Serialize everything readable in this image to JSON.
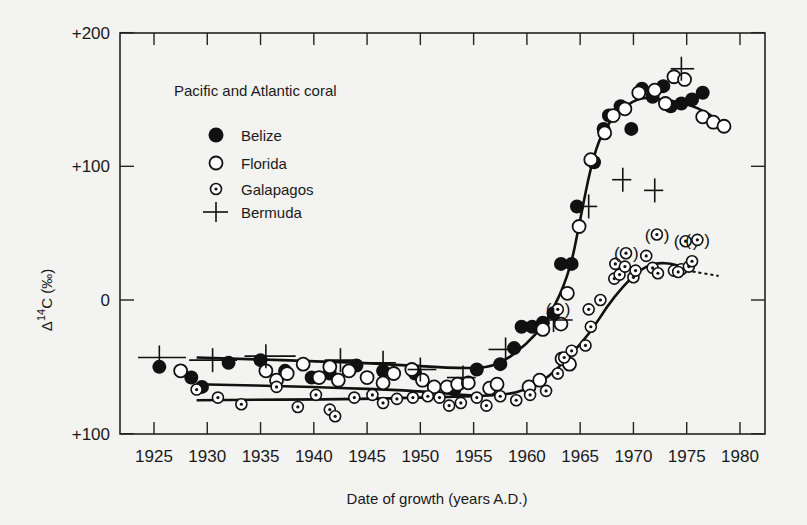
{
  "chart_data": {
    "type": "scatter",
    "title": "Pacific and Atlantic coral",
    "xlabel": "Date of growth (years A.D.)",
    "ylabel": "Δ14C (‰)",
    "xlim": [
      1922,
      1982
    ],
    "ylim": [
      -100,
      200
    ],
    "x_ticks": [
      1925,
      1930,
      1935,
      1940,
      1945,
      1950,
      1955,
      1960,
      1965,
      1970,
      1975,
      1980
    ],
    "y_ticks": [
      {
        "value": 200,
        "label": "+200"
      },
      {
        "value": 100,
        "label": "+100"
      },
      {
        "value": 0,
        "label": "0"
      },
      {
        "value": -100,
        "label": "+100"
      }
    ],
    "grid": false,
    "legend_position": "upper-left",
    "series": [
      {
        "name": "Belize",
        "marker": "filled-circle",
        "points": [
          [
            1925.5,
            -50
          ],
          [
            1928.5,
            -58
          ],
          [
            1929.5,
            -65
          ],
          [
            1932,
            -47
          ],
          [
            1935,
            -45
          ],
          [
            1937.3,
            -53
          ],
          [
            1939.8,
            -58
          ],
          [
            1941.5,
            -55
          ],
          [
            1944,
            -49
          ],
          [
            1946.5,
            -53
          ],
          [
            1949.5,
            -55
          ],
          [
            1953.2,
            -67
          ],
          [
            1955.3,
            -52
          ],
          [
            1957.5,
            -48
          ],
          [
            1958.8,
            -36
          ],
          [
            1959.5,
            -20
          ],
          [
            1960.5,
            -20
          ],
          [
            1961.5,
            -17
          ],
          [
            1962.5,
            -10
          ],
          [
            1963.2,
            27
          ],
          [
            1964.2,
            27
          ],
          [
            1964.7,
            70
          ],
          [
            1966.3,
            103
          ],
          [
            1967.2,
            128
          ],
          [
            1967.7,
            138
          ],
          [
            1968.8,
            145
          ],
          [
            1969.8,
            128
          ],
          [
            1970.8,
            158
          ],
          [
            1971.8,
            152
          ],
          [
            1972.8,
            160
          ],
          [
            1973.5,
            145
          ],
          [
            1974.5,
            147
          ],
          [
            1975.5,
            150
          ],
          [
            1976.5,
            155
          ]
        ]
      },
      {
        "name": "Florida",
        "marker": "open-circle",
        "points": [
          [
            1927.5,
            -53
          ],
          [
            1935.5,
            -53
          ],
          [
            1936.5,
            -60
          ],
          [
            1937.5,
            -55
          ],
          [
            1939,
            -48
          ],
          [
            1940.5,
            -58
          ],
          [
            1941.5,
            -50
          ],
          [
            1942.3,
            -60
          ],
          [
            1943.3,
            -53
          ],
          [
            1945,
            -58
          ],
          [
            1946.5,
            -62
          ],
          [
            1947.5,
            -55
          ],
          [
            1949.2,
            -52
          ],
          [
            1950.2,
            -60
          ],
          [
            1951.3,
            -65
          ],
          [
            1952.5,
            -65
          ],
          [
            1953.5,
            -63
          ],
          [
            1954.5,
            -62
          ],
          [
            1956.5,
            -66
          ],
          [
            1957.2,
            -63
          ],
          [
            1960.2,
            -65
          ],
          [
            1961.2,
            -60
          ],
          [
            1963.3,
            -44
          ],
          [
            1964,
            -48
          ],
          [
            1961.5,
            -22
          ],
          [
            1963.2,
            -18
          ],
          [
            1963.8,
            5
          ],
          [
            1964.9,
            55
          ],
          [
            1966,
            105
          ],
          [
            1967.3,
            125
          ],
          [
            1968.1,
            138
          ],
          [
            1969.2,
            143
          ],
          [
            1970.5,
            155
          ],
          [
            1972,
            157
          ],
          [
            1973,
            147
          ],
          [
            1973.8,
            167
          ],
          [
            1974.8,
            165
          ],
          [
            1976.5,
            137
          ],
          [
            1977.5,
            133
          ],
          [
            1978.5,
            130
          ]
        ]
      },
      {
        "name": "Galapagos",
        "marker": "dotted-circle",
        "points": [
          [
            1929,
            -67
          ],
          [
            1931,
            -73
          ],
          [
            1933.2,
            -78
          ],
          [
            1936.5,
            -65
          ],
          [
            1938.5,
            -80
          ],
          [
            1940.2,
            -71
          ],
          [
            1941.5,
            -82
          ],
          [
            1942,
            -87
          ],
          [
            1943.8,
            -73
          ],
          [
            1945.5,
            -71
          ],
          [
            1946.5,
            -77
          ],
          [
            1947.8,
            -74
          ],
          [
            1949.3,
            -73
          ],
          [
            1950.7,
            -72
          ],
          [
            1951.8,
            -73
          ],
          [
            1952.7,
            -79
          ],
          [
            1953.8,
            -77
          ],
          [
            1955.3,
            -73
          ],
          [
            1956.2,
            -79
          ],
          [
            1957.5,
            -72
          ],
          [
            1959,
            -75
          ],
          [
            1960.3,
            -71
          ],
          [
            1961.8,
            -68
          ],
          [
            1962.9,
            -55
          ],
          [
            1963.5,
            -43
          ],
          [
            1964.2,
            -38
          ],
          [
            1965.5,
            -34
          ],
          [
            1966,
            -20
          ],
          [
            1965.8,
            -7
          ],
          [
            1966.9,
            0
          ],
          [
            1968.2,
            16
          ],
          [
            1968.7,
            19
          ],
          [
            1970,
            17
          ],
          [
            1968.3,
            27
          ],
          [
            1969.2,
            25
          ],
          [
            1970.2,
            22
          ],
          [
            1971.2,
            33
          ],
          [
            1971.8,
            24
          ],
          [
            1972.3,
            20
          ],
          [
            1973.8,
            22
          ],
          [
            1974.5,
            23
          ],
          [
            1974.2,
            21
          ],
          [
            1975.2,
            25
          ],
          [
            1975.5,
            29
          ]
        ],
        "bracketed_points": [
          [
            1962.9,
            -7
          ],
          [
            1969.3,
            35
          ],
          [
            1972.2,
            49
          ],
          [
            1974.9,
            44
          ],
          [
            1976,
            45
          ]
        ]
      },
      {
        "name": "Bermuda",
        "marker": "plus",
        "points": [
          {
            "x": 1925.5,
            "y": -43,
            "xerr_left": 2.0,
            "xerr_right": 2.5
          },
          {
            "x": 1930.5,
            "y": -45,
            "xerr_left": 2.2,
            "xerr_right": 2.3
          },
          {
            "x": 1935.5,
            "y": -42,
            "xerr_left": 2.0,
            "xerr_right": 2.8
          },
          {
            "x": 1942.5,
            "y": -45,
            "xerr_left": 1.5,
            "xerr_right": 1.5
          },
          {
            "x": 1946.5,
            "y": -47,
            "xerr_left": 1.5,
            "xerr_right": 1.2
          },
          {
            "x": 1950,
            "y": -52,
            "xerr_left": 1.2,
            "xerr_right": 1.5
          },
          {
            "x": 1954,
            "y": -58,
            "xerr_left": 1.5,
            "xerr_right": 1.2
          },
          {
            "x": 1958,
            "y": -37,
            "xerr_left": 1.6,
            "xerr_right": 0.8
          },
          {
            "x": 1962.5,
            "y": -15,
            "xerr_left": 1.2,
            "xerr_right": 1.8
          },
          {
            "x": 1965.8,
            "y": 70,
            "xerr_left": 0.8,
            "xerr_right": 0.8
          },
          {
            "x": 1969,
            "y": 90,
            "xerr_left": 1.0,
            "xerr_right": 0.8
          },
          {
            "x": 1972,
            "y": 82,
            "xerr_left": 1.0,
            "xerr_right": 0.8
          },
          {
            "x": 1974.5,
            "y": 173,
            "xerr_left": 1.0,
            "xerr_right": 1.2
          }
        ]
      }
    ],
    "trend_lines": [
      {
        "name": "Atlantic (Belize/Florida) fit",
        "style": "solid",
        "points": [
          [
            1929,
            -43
          ],
          [
            1945,
            -47
          ],
          [
            1955,
            -52
          ],
          [
            1957.5,
            -48
          ],
          [
            1960,
            -33
          ],
          [
            1962,
            -15
          ],
          [
            1964,
            20
          ],
          [
            1965,
            60
          ],
          [
            1966,
            100
          ],
          [
            1967,
            125
          ],
          [
            1968.5,
            140
          ],
          [
            1970.5,
            152
          ],
          [
            1972.5,
            150
          ],
          [
            1975,
            147
          ],
          [
            1977,
            140
          ],
          [
            1979,
            128
          ]
        ]
      },
      {
        "name": "Pacific (Galapagos) fit",
        "style": "solid",
        "points": [
          [
            1929,
            -63
          ],
          [
            1940,
            -65
          ],
          [
            1950,
            -68
          ],
          [
            1955,
            -72
          ],
          [
            1958,
            -71
          ],
          [
            1960,
            -67
          ],
          [
            1962,
            -58
          ],
          [
            1964,
            -42
          ],
          [
            1966,
            -24
          ],
          [
            1967.5,
            -5
          ],
          [
            1969,
            10
          ],
          [
            1970.5,
            22
          ],
          [
            1972,
            28
          ],
          [
            1974,
            27
          ],
          [
            1975,
            22
          ]
        ]
      },
      {
        "name": "Galapagos flat fit",
        "style": "solid",
        "points": [
          [
            1929,
            -75
          ],
          [
            1945,
            -74
          ],
          [
            1955,
            -72
          ]
        ]
      },
      {
        "name": "Pacific extrapolation",
        "style": "dashed",
        "points": [
          [
            1975,
            22
          ],
          [
            1978,
            18
          ]
        ]
      }
    ]
  },
  "legend": {
    "title": "Pacific and Atlantic coral",
    "items": [
      "Belize",
      "Florida",
      "Galapagos",
      "Bermuda"
    ]
  }
}
